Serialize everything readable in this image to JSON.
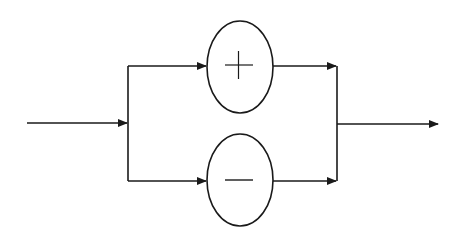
{
  "diagram": {
    "type": "parallel-split-merge",
    "stroke_color": "#1a1a1a",
    "background": "#ffffff",
    "nodes": [
      {
        "id": "plus",
        "symbol": "+",
        "label": "plus",
        "shape": "ellipse"
      },
      {
        "id": "minus",
        "symbol": "−",
        "label": "minus",
        "shape": "ellipse"
      }
    ],
    "edges": [
      {
        "from": "input",
        "to": "split"
      },
      {
        "from": "split",
        "to": "plus"
      },
      {
        "from": "split",
        "to": "minus"
      },
      {
        "from": "plus",
        "to": "merge"
      },
      {
        "from": "minus",
        "to": "merge"
      },
      {
        "from": "merge",
        "to": "output"
      }
    ]
  }
}
